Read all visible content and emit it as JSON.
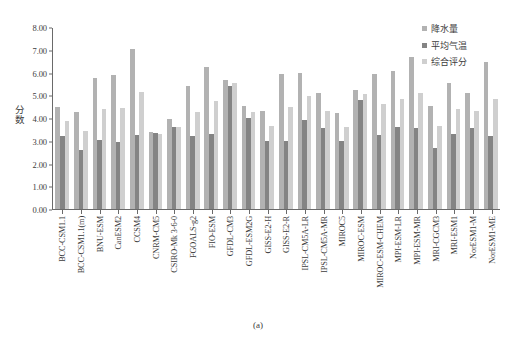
{
  "caption": "(a)",
  "legend": {
    "position": "top-right",
    "items": [
      {
        "label": "降水量",
        "color": "#b2b2b2",
        "icon": "legend-swatch-icon"
      },
      {
        "label": "平均气温",
        "color": "#848484",
        "icon": "legend-swatch-icon"
      },
      {
        "label": "综合评分",
        "color": "#cfcfcf",
        "icon": "legend-swatch-icon"
      }
    ]
  },
  "axes": {
    "ylabel": "分数",
    "yticks": [
      "0.00",
      "1.00",
      "2.00",
      "3.00",
      "4.00",
      "5.00",
      "6.00",
      "7.00",
      "8.00"
    ]
  },
  "chart_data": {
    "type": "bar",
    "title": "",
    "xlabel": "",
    "ylabel": "分数",
    "ylim": [
      0,
      8
    ],
    "ytick_step": 1.0,
    "grid": false,
    "legend_position": "top-right",
    "categories": [
      "BCC-CSM1.1",
      "BCC-CSM1.1(m)",
      "BNU-ESM",
      "CanESM2",
      "CCSM4",
      "CNRM-CM5",
      "CSIRO-Mk 3-6-0",
      "FGOALS-g2",
      "FIO-ESM",
      "GFDL-CM3",
      "GFDL-ESM2G",
      "GISS-E2-H",
      "GISS-E2-R",
      "IPSL-CM5A-LR",
      "IPSL-CM5A-MR",
      "MIROC5",
      "MIROC-ESM",
      "MIROC-ESM-CHEM",
      "MPI-ESM-LR",
      "MPI-ESM-MR",
      "MRI-CGCM3",
      "MRI-ESM1",
      "NorESM1-M",
      "NorESM1-ME"
    ],
    "series": [
      {
        "name": "降水量",
        "color": "#b2b2b2",
        "values": [
          4.5,
          4.25,
          5.75,
          5.9,
          7.05,
          3.4,
          3.95,
          5.4,
          6.25,
          5.65,
          4.55,
          4.3,
          5.95,
          6.0,
          5.1,
          4.2,
          5.25,
          5.95,
          6.05,
          6.7,
          4.55,
          5.55,
          5.1,
          6.45
        ],
        "ylim": [
          0,
          8
        ]
      },
      {
        "name": "平均气温",
        "color": "#848484",
        "values": [
          3.2,
          2.6,
          3.05,
          2.95,
          3.25,
          3.35,
          3.6,
          3.2,
          3.3,
          5.4,
          4.0,
          3.0,
          3.0,
          3.9,
          3.55,
          3.0,
          4.8,
          3.25,
          3.6,
          3.55,
          2.7,
          3.3,
          3.55,
          3.2
        ],
        "ylim": [
          0,
          8
        ]
      },
      {
        "name": "综合评分",
        "color": "#cfcfcf",
        "values": [
          3.85,
          3.45,
          4.4,
          4.45,
          5.15,
          3.3,
          3.6,
          4.25,
          4.75,
          5.55,
          4.25,
          3.65,
          4.5,
          4.95,
          4.3,
          3.6,
          5.05,
          4.6,
          4.85,
          5.1,
          3.65,
          4.4,
          4.3,
          4.85
        ],
        "ylim": [
          0,
          8
        ]
      }
    ]
  }
}
